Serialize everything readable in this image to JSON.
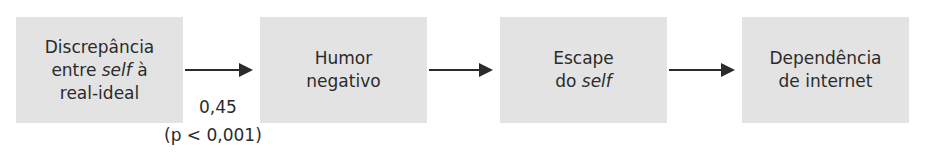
{
  "diagram": {
    "type": "flow",
    "direction": "left-to-right",
    "nodes": [
      {
        "id": "n1",
        "lines": [
          "Discrepância",
          "entre ",
          "self",
          " à",
          "real-ideal"
        ],
        "text": "Discrepância entre self à real-ideal"
      },
      {
        "id": "n2",
        "lines": [
          "Humor",
          "negativo"
        ],
        "text": "Humor negativo"
      },
      {
        "id": "n3",
        "lines": [
          "Escape",
          "do ",
          "self"
        ],
        "text": "Escape do self"
      },
      {
        "id": "n4",
        "lines": [
          "Dependência",
          "de internet"
        ],
        "text": "Dependência de internet"
      }
    ],
    "edges": [
      {
        "from": "n1",
        "to": "n2",
        "label_value": "0,45",
        "label_p": "(p < 0,001)"
      },
      {
        "from": "n2",
        "to": "n3"
      },
      {
        "from": "n3",
        "to": "n4"
      }
    ],
    "colors": {
      "box_fill": "#e3e3e3",
      "text": "#2b2b2b",
      "arrow": "#2b2b2b"
    }
  }
}
